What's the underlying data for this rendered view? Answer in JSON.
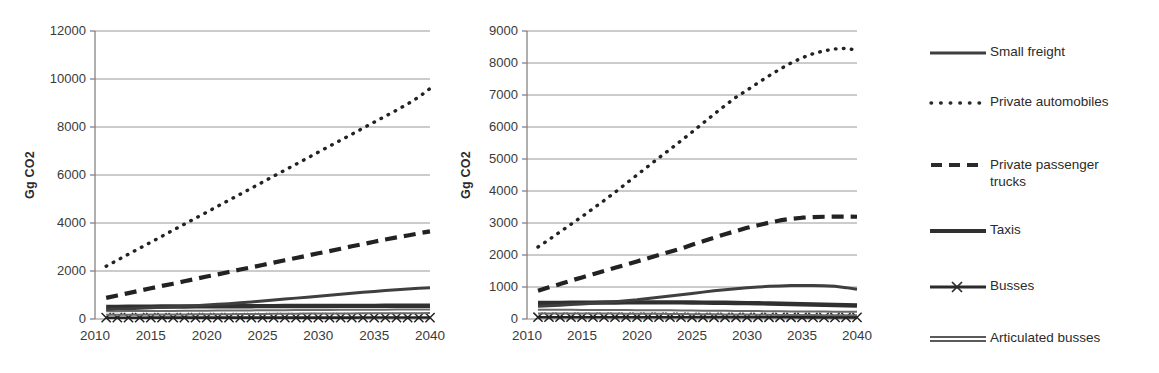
{
  "figure": {
    "ylabel": "Gg CO2"
  },
  "legend": {
    "items": [
      {
        "label": "Small freight",
        "key": "solid-thin-line-icon",
        "color": "#3f3f3f"
      },
      {
        "label": "Private automobiles",
        "key": "dotted-line-icon",
        "color": "#2b2b2b"
      },
      {
        "label": "Private passenger\ntrucks",
        "key": "dashed-line-icon",
        "color": "#2b2b2b"
      },
      {
        "label": "Taxis",
        "key": "solid-thick-line-icon",
        "color": "#303030"
      },
      {
        "label": "Busses",
        "key": "x-marker-line-icon",
        "color": "#2b2b2b"
      },
      {
        "label": "Articulated busses",
        "key": "solid-double-line-icon",
        "color": "#555555"
      }
    ]
  },
  "chart_data": [
    {
      "type": "line",
      "title": "",
      "xlabel": "",
      "ylabel": "Gg CO2",
      "xlim": [
        2010,
        2040
      ],
      "ylim": [
        0,
        12000
      ],
      "ytick_step": 2000,
      "yticks": [
        0,
        2000,
        4000,
        6000,
        8000,
        10000,
        12000
      ],
      "xticks": [
        2010,
        2015,
        2020,
        2025,
        2030,
        2035,
        2040
      ],
      "grid": "horizontal",
      "legend_position": "right-shared",
      "x": [
        2011,
        2012,
        2013,
        2014,
        2015,
        2016,
        2017,
        2018,
        2019,
        2020,
        2021,
        2022,
        2023,
        2024,
        2025,
        2026,
        2027,
        2028,
        2029,
        2030,
        2031,
        2032,
        2033,
        2034,
        2035,
        2036,
        2037,
        2038,
        2039,
        2040
      ],
      "series": [
        {
          "name": "Private automobiles",
          "style": "dotted",
          "values": [
            2200,
            2450,
            2700,
            2950,
            3200,
            3450,
            3700,
            3950,
            4200,
            4450,
            4700,
            4950,
            5200,
            5450,
            5700,
            5950,
            6200,
            6450,
            6700,
            6950,
            7200,
            7450,
            7700,
            7950,
            8200,
            8450,
            8700,
            8960,
            9250,
            9600
          ]
        },
        {
          "name": "Private passenger trucks",
          "style": "dashed",
          "values": [
            880,
            980,
            1080,
            1180,
            1280,
            1380,
            1470,
            1570,
            1670,
            1770,
            1860,
            1960,
            2060,
            2150,
            2250,
            2350,
            2450,
            2540,
            2640,
            2740,
            2830,
            2930,
            3030,
            3120,
            3220,
            3310,
            3400,
            3480,
            3570,
            3650
          ]
        },
        {
          "name": "Small freight",
          "style": "solid-thin",
          "values": [
            400,
            415,
            430,
            450,
            470,
            490,
            510,
            530,
            555,
            580,
            610,
            640,
            675,
            710,
            750,
            790,
            830,
            870,
            910,
            950,
            990,
            1030,
            1070,
            1110,
            1150,
            1185,
            1220,
            1250,
            1280,
            1300
          ]
        },
        {
          "name": "Taxis",
          "style": "solid-thick",
          "values": [
            500,
            505,
            510,
            512,
            515,
            518,
            520,
            522,
            524,
            526,
            528,
            530,
            532,
            534,
            536,
            538,
            540,
            541,
            542,
            543,
            544,
            545,
            546,
            547,
            548,
            549,
            550,
            551,
            552,
            553
          ]
        },
        {
          "name": "Articulated busses",
          "style": "solid-double",
          "values": [
            250,
            252,
            254,
            256,
            258,
            260,
            263,
            266,
            269,
            272,
            275,
            278,
            281,
            284,
            287,
            290,
            293,
            296,
            299,
            302,
            304,
            306,
            308,
            310,
            312,
            314,
            316,
            318,
            319,
            320
          ]
        },
        {
          "name": "Busses",
          "style": "x-marker",
          "values": [
            55,
            55,
            55,
            55,
            56,
            56,
            56,
            56,
            57,
            57,
            57,
            57,
            58,
            58,
            58,
            58,
            58,
            58,
            59,
            59,
            59,
            59,
            59,
            60,
            60,
            60,
            60,
            60,
            60,
            60
          ]
        }
      ]
    },
    {
      "type": "line",
      "title": "",
      "xlabel": "",
      "ylabel": "Gg CO2",
      "xlim": [
        2010,
        2040
      ],
      "ylim": [
        0,
        9000
      ],
      "ytick_step": 1000,
      "yticks": [
        0,
        1000,
        2000,
        3000,
        4000,
        5000,
        6000,
        7000,
        8000,
        9000
      ],
      "xticks": [
        2010,
        2015,
        2020,
        2025,
        2030,
        2035,
        2040
      ],
      "grid": "horizontal",
      "legend_position": "right-shared",
      "x": [
        2011,
        2012,
        2013,
        2014,
        2015,
        2016,
        2017,
        2018,
        2019,
        2020,
        2021,
        2022,
        2023,
        2024,
        2025,
        2026,
        2027,
        2028,
        2029,
        2030,
        2031,
        2032,
        2033,
        2034,
        2035,
        2036,
        2037,
        2038,
        2039,
        2040
      ],
      "series": [
        {
          "name": "Private automobiles",
          "style": "dotted",
          "values": [
            2250,
            2480,
            2720,
            2960,
            3200,
            3450,
            3700,
            3960,
            4230,
            4500,
            4770,
            5040,
            5300,
            5570,
            5840,
            6120,
            6400,
            6670,
            6930,
            7150,
            7380,
            7600,
            7810,
            8000,
            8160,
            8290,
            8380,
            8440,
            8460,
            8400
          ]
        },
        {
          "name": "Private passenger trucks",
          "style": "dashed",
          "values": [
            880,
            990,
            1090,
            1200,
            1300,
            1400,
            1500,
            1600,
            1700,
            1800,
            1900,
            2000,
            2100,
            2200,
            2320,
            2430,
            2540,
            2650,
            2750,
            2850,
            2930,
            3010,
            3080,
            3130,
            3165,
            3185,
            3195,
            3200,
            3200,
            3195
          ]
        },
        {
          "name": "Small freight",
          "style": "solid-thin",
          "values": [
            400,
            415,
            430,
            450,
            470,
            490,
            515,
            540,
            570,
            600,
            640,
            680,
            720,
            760,
            800,
            840,
            880,
            915,
            945,
            975,
            1000,
            1020,
            1035,
            1045,
            1050,
            1050,
            1040,
            1020,
            980,
            930
          ]
        },
        {
          "name": "Taxis",
          "style": "solid-thick",
          "values": [
            500,
            502,
            505,
            507,
            510,
            512,
            514,
            516,
            518,
            520,
            520,
            520,
            519,
            518,
            516,
            513,
            510,
            506,
            502,
            497,
            491,
            484,
            477,
            470,
            462,
            454,
            446,
            438,
            430,
            420
          ]
        },
        {
          "name": "Articulated busses",
          "style": "solid-double",
          "values": [
            230,
            230,
            230,
            229,
            228,
            227,
            226,
            225,
            223,
            221,
            219,
            217,
            214,
            211,
            208,
            205,
            202,
            199,
            196,
            193,
            190,
            187,
            185,
            182,
            180,
            178,
            176,
            174,
            172,
            170
          ]
        },
        {
          "name": "Busses",
          "style": "x-marker",
          "values": [
            55,
            55,
            55,
            55,
            55,
            55,
            55,
            55,
            55,
            55,
            55,
            55,
            55,
            55,
            54,
            54,
            54,
            54,
            54,
            54,
            53,
            53,
            53,
            53,
            52,
            52,
            52,
            52,
            51,
            51
          ]
        }
      ]
    }
  ]
}
